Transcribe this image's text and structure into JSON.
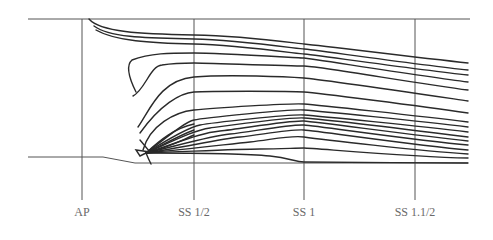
{
  "diagram": {
    "type": "ship-hull-lines-plan",
    "colors": {
      "frame": "#555555",
      "curve": "#2a2a2a",
      "label": "#6a6a6a",
      "background": "#ffffff"
    },
    "stations": [
      {
        "label": "AP",
        "x": 82
      },
      {
        "label": "SS 1/2",
        "x": 194
      },
      {
        "label": "SS 1",
        "x": 304
      },
      {
        "label": "SS 1.1/2",
        "x": 415
      }
    ],
    "frame": {
      "top_line": {
        "x1": 28,
        "x2": 470,
        "y": 19
      },
      "station_line_bottom": 200,
      "baseline_points": "28,157 103,157 135,163 468,163"
    },
    "curves": [
      "M89,19 C100,32 140,34 194,35 S300,44 304,44 S420,58 468,63",
      "M94,26 C110,38 150,38 194,39 S300,49 304,49 S420,65 468,70",
      "M96,30 C115,41 150,43 194,44 S300,54 304,54 S420,70 468,75",
      "M136,92 C130,80 125,66 132,60 C150,53 170,53 194,53 S300,58 304,58 S420,76 468,82",
      "M133,96 C145,90 150,66 162,65 C175,63 185,63 194,63 S290,66 304,66 S420,84 468,90",
      "M138,127 C150,110 160,80 194,77 S290,77 304,78 S420,94 468,101",
      "M140,133 C160,105 180,93 194,92 S290,91 304,92 S420,106 468,113",
      "M143,150 C150,125 175,112 194,110 S290,103 304,104 S420,116 468,122",
      "M146,153 C170,135 185,122 194,120 S290,109 304,110 S420,121 468,127",
      "M146,153 C170,138 190,127 200,125 S290,114 304,115 S420,126 468,132",
      "M146,153 C175,140 195,130 210,128 S290,117 304,118 S420,131 468,137",
      "M146,153 C180,142 200,133 220,131 S290,120 304,121 S420,136 468,141",
      "M146,153 C180,145 210,136 230,134 S290,124 304,125 S420,141 468,145",
      "M146,153 C185,147 220,139 240,137 S290,129 304,130 S420,146 468,150",
      "M146,153 C190,149 230,144 250,142 S290,135 304,137 S420,151 468,154",
      "M146,153 C200,151 240,149 260,149 S295,148 304,148 S410,157 468,158",
      "M146,153 C200,153 250,154 270,156 S295,162 304,162 S430,163 468,163",
      "M146,153 C160,140 175,128 194,124",
      "M146,153 C165,144 178,136 194,130",
      "M146,153 C170,147 182,140 194,135",
      "M140,140 L150,152 L136,150 L140,156 L146,153",
      "M146,153 C148,158 150,162 151,164"
    ]
  }
}
